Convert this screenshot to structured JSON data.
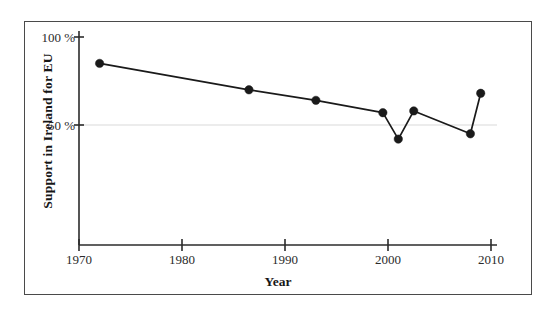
{
  "chart_data": {
    "type": "line",
    "title": "",
    "subtitle": "",
    "xlabel": "Year",
    "ylabel": "Support in Ireland for EU",
    "xlim": [
      1970,
      2010
    ],
    "ylim": [
      12,
      105
    ],
    "xticks": [
      1970,
      1980,
      1990,
      2000,
      2010
    ],
    "xtick_labels": [
      "1970",
      "1980",
      "1990",
      "2000",
      "2010"
    ],
    "yticks": [
      50,
      100
    ],
    "ytick_labels": [
      "50 %",
      "100 %"
    ],
    "grid": "horizontal-at-50",
    "legend": "none",
    "marker": "filled-circle",
    "line_color": "#1a1a1a",
    "marker_color": "#1a1a1a",
    "grid_color": "#d9d9d9",
    "axis_color": "#2b2b2b",
    "frame_color": "#4a4a4a",
    "background": "#ffffff",
    "x": [
      1972,
      1986.5,
      1993,
      1999.5,
      2001,
      2002.5,
      2008,
      2009
    ],
    "values": [
      85,
      70,
      64,
      57,
      42,
      58,
      45,
      68
    ],
    "points": [
      {
        "year": 1972,
        "support": 85
      },
      {
        "year": 1986.5,
        "support": 70
      },
      {
        "year": 1993,
        "support": 64
      },
      {
        "year": 1999.5,
        "support": 57
      },
      {
        "year": 2001,
        "support": 42
      },
      {
        "year": 2002.5,
        "support": 58
      },
      {
        "year": 2008,
        "support": 45
      },
      {
        "year": 2009,
        "support": 68
      }
    ]
  },
  "axes": {
    "y_tick_100": "100 %",
    "y_tick_50": "50 %",
    "x_tick_1970": "1970",
    "x_tick_1980": "1980",
    "x_tick_1990": "1990",
    "x_tick_2000": "2000",
    "x_tick_2010": "2010",
    "x_title": "Year",
    "y_title": "Support in Ireland for EU"
  }
}
